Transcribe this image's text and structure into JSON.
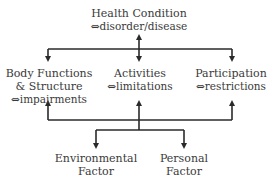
{
  "diagram": {
    "nodes": {
      "health": {
        "title": "Health Condition",
        "sub": "⇔disorder/disease"
      },
      "body": {
        "title": "Body Functions",
        "title2": "& Structure",
        "sub": "⇔impairments"
      },
      "activities": {
        "title": "Activities",
        "sub": "⇔limitations"
      },
      "participation": {
        "title": "Participation",
        "sub": "⇔restrictions"
      },
      "environmental": {
        "title": "Environmental",
        "title2": "Factor"
      },
      "personal": {
        "title": "Personal",
        "title2": "Factor"
      }
    },
    "edges": [
      {
        "from": "health",
        "to": "activities",
        "type": "bidirectional"
      },
      {
        "from": "health",
        "to": "body",
        "type": "arrow"
      },
      {
        "from": "health",
        "to": "participation",
        "type": "arrow"
      },
      {
        "from": "activities",
        "to": "body",
        "type": "arrow"
      },
      {
        "from": "activities",
        "to": "participation",
        "type": "arrow"
      },
      {
        "from": "activities",
        "to": "environmental",
        "type": "arrow"
      },
      {
        "from": "activities",
        "to": "personal",
        "type": "arrow"
      }
    ],
    "line_color": "#2a2a2a"
  }
}
